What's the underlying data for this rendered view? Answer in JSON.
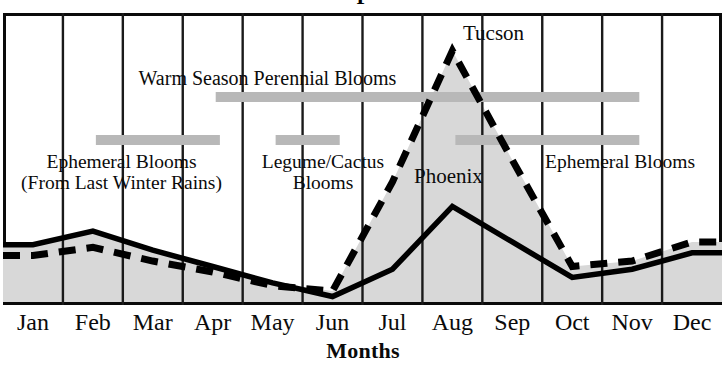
{
  "chart_data": {
    "type": "area",
    "title_clipped": true,
    "xlabel": "Months",
    "ylabel": "",
    "grid": true,
    "legend_position": "inline-annotations",
    "categories": [
      "Jan",
      "Feb",
      "Mar",
      "Apr",
      "May",
      "Jun",
      "Jul",
      "Aug",
      "Sep",
      "Oct",
      "Nov",
      "Dec"
    ],
    "series": [
      {
        "name": "Tucson",
        "style": "dashed",
        "color": "#000000",
        "values": [
          17,
          20,
          15,
          11,
          6,
          4,
          44,
          92,
          52,
          13,
          15,
          22
        ]
      },
      {
        "name": "Phoenix",
        "style": "solid",
        "color": "#000000",
        "values": [
          21,
          26,
          19,
          13,
          7,
          2,
          12,
          35,
          22,
          9,
          12,
          18
        ]
      }
    ],
    "ylim": [
      0,
      100
    ],
    "shaded_between_series": true,
    "shade_color": "#d8d8d8",
    "bloom_bars": [
      {
        "label": "Warm Season Perennial Blooms",
        "start_month": "Apr",
        "end_month": "Nov",
        "row": "upper"
      },
      {
        "label": "Ephemeral Blooms (From Last Winter Rains)",
        "start_month": "Feb",
        "end_month": "Apr",
        "row": "lower"
      },
      {
        "label": "Legume/Cactus Blooms",
        "start_month": "May",
        "end_month": "Jun",
        "row": "lower"
      },
      {
        "label": "Ephemeral Blooms",
        "start_month": "Aug",
        "end_month": "Nov",
        "row": "lower"
      }
    ]
  },
  "annotations": {
    "warm_season": "Warm Season Perennial Blooms",
    "ephemeral_left_line1": "Ephemeral Blooms",
    "ephemeral_left_line2": "(From Last Winter Rains)",
    "legume_line1": "Legume/Cactus",
    "legume_line2": "Blooms",
    "ephemeral_right": "Ephemeral Blooms",
    "tucson": "Tucson",
    "phoenix": "Phoenix"
  },
  "axis": {
    "x_title": "Months",
    "ticks": [
      "Jan",
      "Feb",
      "Mar",
      "Apr",
      "May",
      "Jun",
      "Jul",
      "Aug",
      "Sep",
      "Oct",
      "Nov",
      "Dec"
    ]
  },
  "title_fragment": "P",
  "colors": {
    "line": "#000000",
    "shade": "#d8d8d8",
    "bar": "#b8b8b8",
    "frame": "#0a0a0a",
    "gridline": "#1a1a1a",
    "background": "#ffffff"
  }
}
